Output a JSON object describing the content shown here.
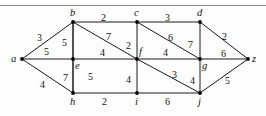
{
  "figure": {
    "width": 266,
    "height": 116,
    "edge_color": "#1a1a1a",
    "vertex_color": "#000000",
    "background": "#fdfdfd",
    "rule_color": "#8c8c8c"
  },
  "chart_data": {
    "type": "diagram",
    "subtype": "weighted-undirected-graph",
    "title": "",
    "xlabel": "",
    "ylabel": "",
    "grid": false,
    "legend": null,
    "nodes": [
      {
        "id": "a",
        "label": "a",
        "x": 22,
        "y": 59,
        "label_dx": -11,
        "label_dy": -5
      },
      {
        "id": "b",
        "label": "b",
        "x": 73,
        "y": 22,
        "label_dx": -3,
        "label_dy": -14
      },
      {
        "id": "c",
        "label": "c",
        "x": 137,
        "y": 22,
        "label_dx": -3,
        "label_dy": -14
      },
      {
        "id": "d",
        "label": "d",
        "x": 200,
        "y": 22,
        "label_dx": -3,
        "label_dy": -14
      },
      {
        "id": "e",
        "label": "e",
        "x": 73,
        "y": 59,
        "label_dx": 2,
        "label_dy": 2
      },
      {
        "id": "f",
        "label": "f",
        "x": 137,
        "y": 59,
        "label_dx": 2,
        "label_dy": -12
      },
      {
        "id": "g",
        "label": "g",
        "x": 200,
        "y": 59,
        "label_dx": 2,
        "label_dy": 2
      },
      {
        "id": "h",
        "label": "h",
        "x": 73,
        "y": 93,
        "label_dx": -3,
        "label_dy": 4
      },
      {
        "id": "i",
        "label": "i",
        "x": 137,
        "y": 93,
        "label_dx": -2,
        "label_dy": 4
      },
      {
        "id": "j",
        "label": "j",
        "x": 200,
        "y": 93,
        "label_dx": -2,
        "label_dy": 4
      },
      {
        "id": "z",
        "label": "z",
        "x": 248,
        "y": 59,
        "label_dx": 4,
        "label_dy": -5
      }
    ],
    "edges": [
      {
        "from": "a",
        "to": "b",
        "weight": 3,
        "wx": 37,
        "wy": 33
      },
      {
        "from": "a",
        "to": "e",
        "weight": 5,
        "wx": 44,
        "wy": 47
      },
      {
        "from": "a",
        "to": "h",
        "weight": 4,
        "wx": 40,
        "wy": 80
      },
      {
        "from": "b",
        "to": "c",
        "weight": 2,
        "wx": 101,
        "wy": 13
      },
      {
        "from": "b",
        "to": "e",
        "weight": 5,
        "wx": 62,
        "wy": 38
      },
      {
        "from": "b",
        "to": "f",
        "weight": 7,
        "wx": 106,
        "wy": 32
      },
      {
        "from": "b",
        "to": "h",
        "weight": 5,
        "wx": 88,
        "wy": 72
      },
      {
        "from": "c",
        "to": "d",
        "weight": 3,
        "wx": 165,
        "wy": 13
      },
      {
        "from": "c",
        "to": "f",
        "weight": 2,
        "wx": 126,
        "wy": 41
      },
      {
        "from": "c",
        "to": "g",
        "weight": 6,
        "wx": 168,
        "wy": 33
      },
      {
        "from": "d",
        "to": "g",
        "weight": 7,
        "wx": 188,
        "wy": 40
      },
      {
        "from": "d",
        "to": "z",
        "weight": 2,
        "wx": 222,
        "wy": 32
      },
      {
        "from": "e",
        "to": "f",
        "weight": 4,
        "wx": 100,
        "wy": 48
      },
      {
        "from": "e",
        "to": "h",
        "weight": 7,
        "wx": 63,
        "wy": 73
      },
      {
        "from": "f",
        "to": "g",
        "weight": 4,
        "wx": 163,
        "wy": 48
      },
      {
        "from": "f",
        "to": "i",
        "weight": 4,
        "wx": 126,
        "wy": 75
      },
      {
        "from": "f",
        "to": "j",
        "weight": 3,
        "wx": 172,
        "wy": 70
      },
      {
        "from": "g",
        "to": "j",
        "weight": 4,
        "wx": 190,
        "wy": 76
      },
      {
        "from": "g",
        "to": "z",
        "weight": 6,
        "wx": 221,
        "wy": 49
      },
      {
        "from": "h",
        "to": "i",
        "weight": 2,
        "wx": 102,
        "wy": 97
      },
      {
        "from": "i",
        "to": "j",
        "weight": 6,
        "wx": 165,
        "wy": 97
      },
      {
        "from": "j",
        "to": "z",
        "weight": 5,
        "wx": 225,
        "wy": 76
      }
    ]
  }
}
